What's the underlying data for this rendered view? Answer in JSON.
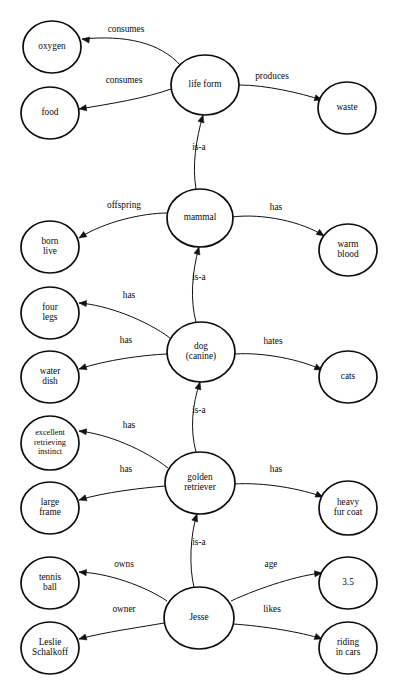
{
  "document": {
    "title": "Semantic network: life form / mammal / dog / golden retriever / Jesse",
    "background_color": "#ffffff",
    "ink_color": "#0d0d0d",
    "width": 397,
    "height": 688
  },
  "header_ghost": {
    "line1": "",
    "line2": "",
    "line3": ""
  },
  "graph": {
    "type": "semantic-network",
    "nodes": [
      {
        "id": "oxygen",
        "label": "oxygen",
        "lines": [
          "oxygen"
        ],
        "cx": 52,
        "cy": 47,
        "rx": 29,
        "ry": 26
      },
      {
        "id": "food",
        "label": "food",
        "lines": [
          "food"
        ],
        "cx": 50,
        "cy": 113,
        "rx": 29,
        "ry": 26
      },
      {
        "id": "life_form",
        "label": "life form",
        "lines": [
          "life form"
        ],
        "cx": 205,
        "cy": 85,
        "rx": 34,
        "ry": 30
      },
      {
        "id": "waste",
        "label": "waste",
        "lines": [
          "waste"
        ],
        "cx": 347,
        "cy": 108,
        "rx": 29,
        "ry": 26
      },
      {
        "id": "mammal",
        "label": "mammal",
        "lines": [
          "mammal"
        ],
        "cx": 200,
        "cy": 218,
        "rx": 33,
        "ry": 29
      },
      {
        "id": "born_live",
        "label": "born live",
        "lines": [
          "born",
          "live"
        ],
        "cx": 50,
        "cy": 247,
        "rx": 29,
        "ry": 26
      },
      {
        "id": "warm_blood",
        "label": "warm blood",
        "lines": [
          "warm",
          "blood"
        ],
        "cx": 348,
        "cy": 250,
        "rx": 29,
        "ry": 26
      },
      {
        "id": "four_legs",
        "label": "four legs",
        "lines": [
          "four",
          "legs"
        ],
        "cx": 50,
        "cy": 313,
        "rx": 29,
        "ry": 26
      },
      {
        "id": "dog",
        "label": "dog (canine)",
        "lines": [
          "dog",
          "(canine)"
        ],
        "cx": 201,
        "cy": 352,
        "rx": 34,
        "ry": 30
      },
      {
        "id": "water_dish",
        "label": "water dish",
        "lines": [
          "water",
          "dish"
        ],
        "cx": 50,
        "cy": 377,
        "rx": 29,
        "ry": 26
      },
      {
        "id": "cats",
        "label": "cats",
        "lines": [
          "cats"
        ],
        "cx": 348,
        "cy": 377,
        "rx": 29,
        "ry": 26
      },
      {
        "id": "instinct",
        "label": "excellent retrieving instinct",
        "lines": [
          "excellent",
          "retrieving",
          "instinct"
        ],
        "cx": 50,
        "cy": 443,
        "rx": 29,
        "ry": 27
      },
      {
        "id": "golden",
        "label": "golden retriever",
        "lines": [
          "golden",
          "retriever"
        ],
        "cx": 200,
        "cy": 483,
        "rx": 35,
        "ry": 31
      },
      {
        "id": "large_frame",
        "label": "large frame",
        "lines": [
          "large",
          "frame"
        ],
        "cx": 50,
        "cy": 508,
        "rx": 29,
        "ry": 26
      },
      {
        "id": "heavy_fur",
        "label": "heavy fur coat",
        "lines": [
          "heavy",
          "fur coat"
        ],
        "cx": 348,
        "cy": 508,
        "rx": 29,
        "ry": 27
      },
      {
        "id": "tennis_ball",
        "label": "tennis ball",
        "lines": [
          "tennis",
          "ball"
        ],
        "cx": 50,
        "cy": 583,
        "rx": 29,
        "ry": 26
      },
      {
        "id": "jesse",
        "label": "Jesse",
        "lines": [
          "Jesse"
        ],
        "cx": 199,
        "cy": 618,
        "rx": 35,
        "ry": 31
      },
      {
        "id": "age_value",
        "label": "3.5",
        "lines": [
          "3.5"
        ],
        "cx": 348,
        "cy": 583,
        "rx": 29,
        "ry": 26
      },
      {
        "id": "leslie",
        "label": "Leslie Schalkoff",
        "lines": [
          "Leslie",
          "Schalkoff"
        ],
        "cx": 50,
        "cy": 648,
        "rx": 29,
        "ry": 26
      },
      {
        "id": "riding",
        "label": "riding in cars",
        "lines": [
          "riding",
          "in cars"
        ],
        "cx": 348,
        "cy": 648,
        "rx": 29,
        "ry": 26
      }
    ],
    "edges": [
      {
        "id": "e1",
        "from": "life_form",
        "to": "oxygen",
        "label": "consumes",
        "label_x": 126,
        "label_y": 30,
        "path": "M 181,66 C 160,42 125,35 82,39",
        "arrow_at": [
          82,
          39
        ],
        "arrow_angle": 188
      },
      {
        "id": "e2",
        "from": "life_form",
        "to": "food",
        "label": "consumes",
        "label_x": 124,
        "label_y": 81,
        "path": "M 171,89 C 146,98 110,104 79,109",
        "arrow_at": [
          79,
          109
        ],
        "arrow_angle": 170
      },
      {
        "id": "e3",
        "from": "life_form",
        "to": "waste",
        "label": "produces",
        "label_x": 272,
        "label_y": 77,
        "path": "M 239,85 C 266,85 300,93 322,100",
        "arrow_at": [
          322,
          100
        ],
        "arrow_angle": 18
      },
      {
        "id": "e4",
        "from": "mammal",
        "to": "life_form",
        "label": "is-a",
        "label_x": 199,
        "label_y": 148,
        "path": "M 196,189 C 192,165 196,140 203,115",
        "arrow_at": [
          203,
          115
        ],
        "arrow_angle": -74
      },
      {
        "id": "e5",
        "from": "mammal",
        "to": "born_live",
        "label": "offspring",
        "label_x": 124,
        "label_y": 206,
        "path": "M 168,213 C 142,213 104,222 79,238",
        "arrow_at": [
          79,
          238
        ],
        "arrow_angle": 148
      },
      {
        "id": "e6",
        "from": "mammal",
        "to": "warm_blood",
        "label": "has",
        "label_x": 276,
        "label_y": 208,
        "path": "M 232,217 C 263,213 303,222 324,236",
        "arrow_at": [
          324,
          236
        ],
        "arrow_angle": 34
      },
      {
        "id": "e7",
        "from": "dog",
        "to": "mammal",
        "label": "is-a",
        "label_x": 199,
        "label_y": 278,
        "path": "M 196,322 C 190,300 192,272 199,247",
        "arrow_at": [
          199,
          247
        ],
        "arrow_angle": -74
      },
      {
        "id": "e8",
        "from": "dog",
        "to": "four_legs",
        "label": "has",
        "label_x": 129,
        "label_y": 296,
        "path": "M 170,338 C 146,320 107,305 79,303",
        "arrow_at": [
          79,
          303
        ],
        "arrow_angle": 184
      },
      {
        "id": "e9",
        "from": "dog",
        "to": "water_dish",
        "label": "has",
        "label_x": 126,
        "label_y": 341,
        "path": "M 167,354 C 143,355 106,360 79,369",
        "arrow_at": [
          79,
          369
        ],
        "arrow_angle": 162
      },
      {
        "id": "e10",
        "from": "dog",
        "to": "cats",
        "label": "hates",
        "label_x": 273,
        "label_y": 342,
        "path": "M 235,354 C 264,352 302,360 322,370",
        "arrow_at": [
          322,
          370
        ],
        "arrow_angle": 25
      },
      {
        "id": "e11",
        "from": "golden",
        "to": "dog",
        "label": "is-a",
        "label_x": 199,
        "label_y": 411,
        "path": "M 196,452 C 190,430 192,405 200,382",
        "arrow_at": [
          200,
          382
        ],
        "arrow_angle": -74
      },
      {
        "id": "e12",
        "from": "golden",
        "to": "instinct",
        "label": "has",
        "label_x": 129,
        "label_y": 426,
        "path": "M 168,468 C 145,450 108,434 79,431",
        "arrow_at": [
          79,
          431
        ],
        "arrow_angle": 186
      },
      {
        "id": "e13",
        "from": "golden",
        "to": "large_frame",
        "label": "has",
        "label_x": 126,
        "label_y": 470,
        "path": "M 165,486 C 142,488 105,492 79,500",
        "arrow_at": [
          79,
          500
        ],
        "arrow_angle": 163
      },
      {
        "id": "e14",
        "from": "golden",
        "to": "heavy_fur",
        "label": "has",
        "label_x": 276,
        "label_y": 470,
        "path": "M 234,484 C 264,482 302,489 323,497",
        "arrow_at": [
          323,
          497
        ],
        "arrow_angle": 22
      },
      {
        "id": "e15",
        "from": "jesse",
        "to": "golden",
        "label": "is-a",
        "label_x": 199,
        "label_y": 543,
        "path": "M 194,587 C 189,567 190,536 197,514",
        "arrow_at": [
          197,
          514
        ],
        "arrow_angle": -72
      },
      {
        "id": "e16",
        "from": "jesse",
        "to": "tennis_ball",
        "label": "owns",
        "label_x": 124,
        "label_y": 565,
        "path": "M 167,601 C 145,586 108,573 79,572",
        "arrow_at": [
          79,
          572
        ],
        "arrow_angle": 185
      },
      {
        "id": "e17",
        "from": "jesse",
        "to": "leslie",
        "label": "owner",
        "label_x": 124,
        "label_y": 610,
        "path": "M 164,623 C 142,627 105,632 79,639",
        "arrow_at": [
          79,
          639
        ],
        "arrow_angle": 164
      },
      {
        "id": "e18",
        "from": "jesse",
        "to": "age_value",
        "label": "age",
        "label_x": 271,
        "label_y": 565,
        "path": "M 231,601 C 261,587 300,575 322,573",
        "arrow_at": [
          322,
          573
        ],
        "arrow_angle": -6
      },
      {
        "id": "e19",
        "from": "jesse",
        "to": "riding",
        "label": "likes",
        "label_x": 272,
        "label_y": 610,
        "path": "M 233,624 C 263,626 301,632 322,639",
        "arrow_at": [
          322,
          639
        ],
        "arrow_angle": 20
      }
    ]
  }
}
